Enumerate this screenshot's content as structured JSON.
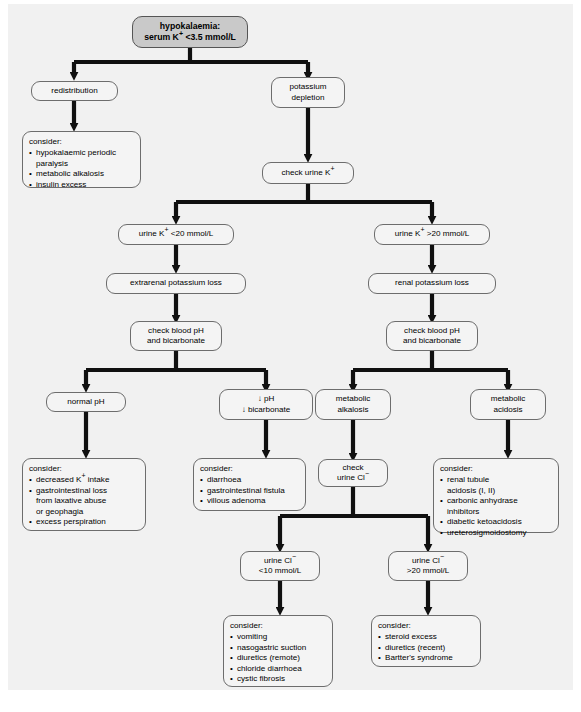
{
  "figure": {
    "title_label": "hypokalaemia diagnostic flowchart",
    "caption": ""
  },
  "colors": {
    "page_background": "#ffffff",
    "canvas_background": "#f1f1f1",
    "node_fill": "#f4f4f4",
    "node_border": "#6d6d6d",
    "root_fill": "#c9c9c9",
    "connector": "#101010"
  },
  "nodes": {
    "root": {
      "line1": "hypokalaemia:",
      "line2": "serum K+ <3.5 mmol/L"
    },
    "redistribution": {
      "label": "redistribution"
    },
    "potassium_depletion": {
      "line1": "potassium",
      "line2": "depletion"
    },
    "consider_redistribution": {
      "head": "consider:",
      "items": [
        "hypokalaemic periodic paralysis",
        "metabolic alkalosis",
        "insulin excess"
      ]
    },
    "check_urine_k": {
      "label": "check urine K+"
    },
    "urine_k_low": {
      "label": "urine K+ <20 mmol/L"
    },
    "urine_k_high": {
      "label": "urine K+ >20 mmol/L"
    },
    "extrarenal_loss": {
      "label": "extrarenal potassium loss"
    },
    "renal_loss": {
      "label": "renal potassium loss"
    },
    "check_ph_left": {
      "line1": "check blood pH",
      "line2": "and bicarbonate"
    },
    "check_ph_right": {
      "line1": "check blood pH",
      "line2": "and bicarbonate"
    },
    "normal_ph": {
      "label": "normal pH"
    },
    "low_ph": {
      "line1": "↓ pH",
      "line2": "↓ bicarbonate"
    },
    "metabolic_alkalosis": {
      "line1": "metabolic",
      "line2": "alkalosis"
    },
    "metabolic_acidosis": {
      "line1": "metabolic",
      "line2": "acidosis"
    },
    "consider_normal_ph": {
      "head": "consider:",
      "items": [
        "decreased K+ intake",
        "gastrointestinal loss from laxative abuse or geophagia",
        "excess perspiration"
      ]
    },
    "consider_low_ph": {
      "head": "consider:",
      "items": [
        "diarrhoea",
        "gastrointestinal fistula",
        "villous adenoma"
      ]
    },
    "check_urine_cl": {
      "line1": "check",
      "line2": "urine Cl−"
    },
    "consider_acidosis": {
      "head": "consider:",
      "items": [
        "renal tubule acidosis (I, II)",
        "carbonic anhydrase inhibitors",
        "diabetic ketoacidosis",
        "ureterosigmoidostomy"
      ]
    },
    "urine_cl_low": {
      "line1": "urine Cl−",
      "line2": "<10 mmol/L"
    },
    "urine_cl_high": {
      "line1": "urine Cl−",
      "line2": ">20 mmol/L"
    },
    "consider_cl_low": {
      "head": "consider:",
      "items": [
        "vomiting",
        "nasogastric suction",
        "diuretics (remote)",
        "chloride diarrhoea",
        "cystic fibrosis"
      ]
    },
    "consider_cl_high": {
      "head": "consider:",
      "items": [
        "steroid excess",
        "diuretics (recent)",
        "Bartter's syndrome"
      ]
    }
  }
}
